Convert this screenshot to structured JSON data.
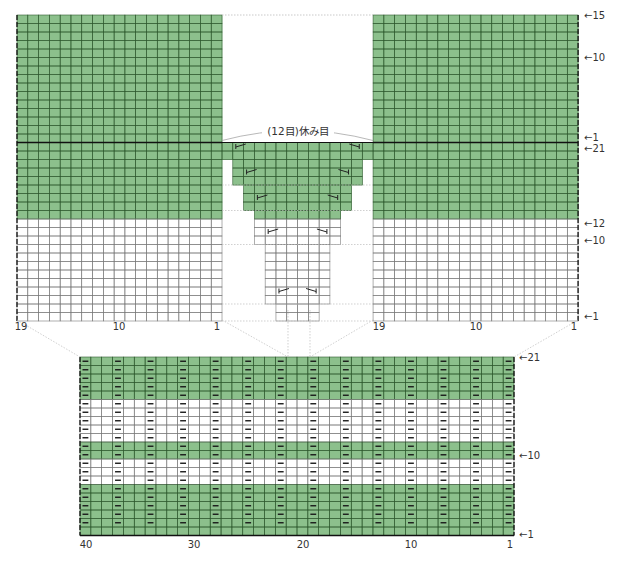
{
  "colors": {
    "green": "#8cc08c",
    "grid_green": "#2f5a2f",
    "grid_white": "#7a7a7a",
    "line": "#111111",
    "guide": "#bbbbbb"
  },
  "top_chart": {
    "left_piece": {
      "cols": 19
    },
    "center_piece": {
      "cols": 14
    },
    "right_piece": {
      "cols": 19
    },
    "shoulder_rows": 15,
    "body_rows": 21,
    "green_body_rows_from_top": 9,
    "note": "(12目)休み目",
    "row_labels": [
      {
        "text": "←15"
      },
      {
        "text": "←10"
      },
      {
        "text": "←1"
      },
      {
        "text": "←21"
      },
      {
        "text": "←12"
      },
      {
        "text": "←10"
      },
      {
        "text": "←1"
      }
    ],
    "col_labels_left": [
      {
        "text": "19"
      },
      {
        "text": "10"
      },
      {
        "text": "1"
      }
    ],
    "col_labels_right": [
      {
        "text": "19"
      },
      {
        "text": "10"
      },
      {
        "text": "1"
      }
    ]
  },
  "bottom_chart": {
    "cols": 40,
    "rows": 21,
    "purl_symbol": "−",
    "stripe_rows_green": [
      1,
      2,
      3,
      4,
      5,
      6,
      10,
      11,
      17,
      18,
      19,
      20,
      21
    ],
    "row_labels": [
      {
        "text": "←21"
      },
      {
        "text": "←10"
      },
      {
        "text": "←1"
      }
    ],
    "col_labels": [
      {
        "text": "40"
      },
      {
        "text": "30"
      },
      {
        "text": "20"
      },
      {
        "text": "10"
      },
      {
        "text": "1"
      }
    ]
  }
}
